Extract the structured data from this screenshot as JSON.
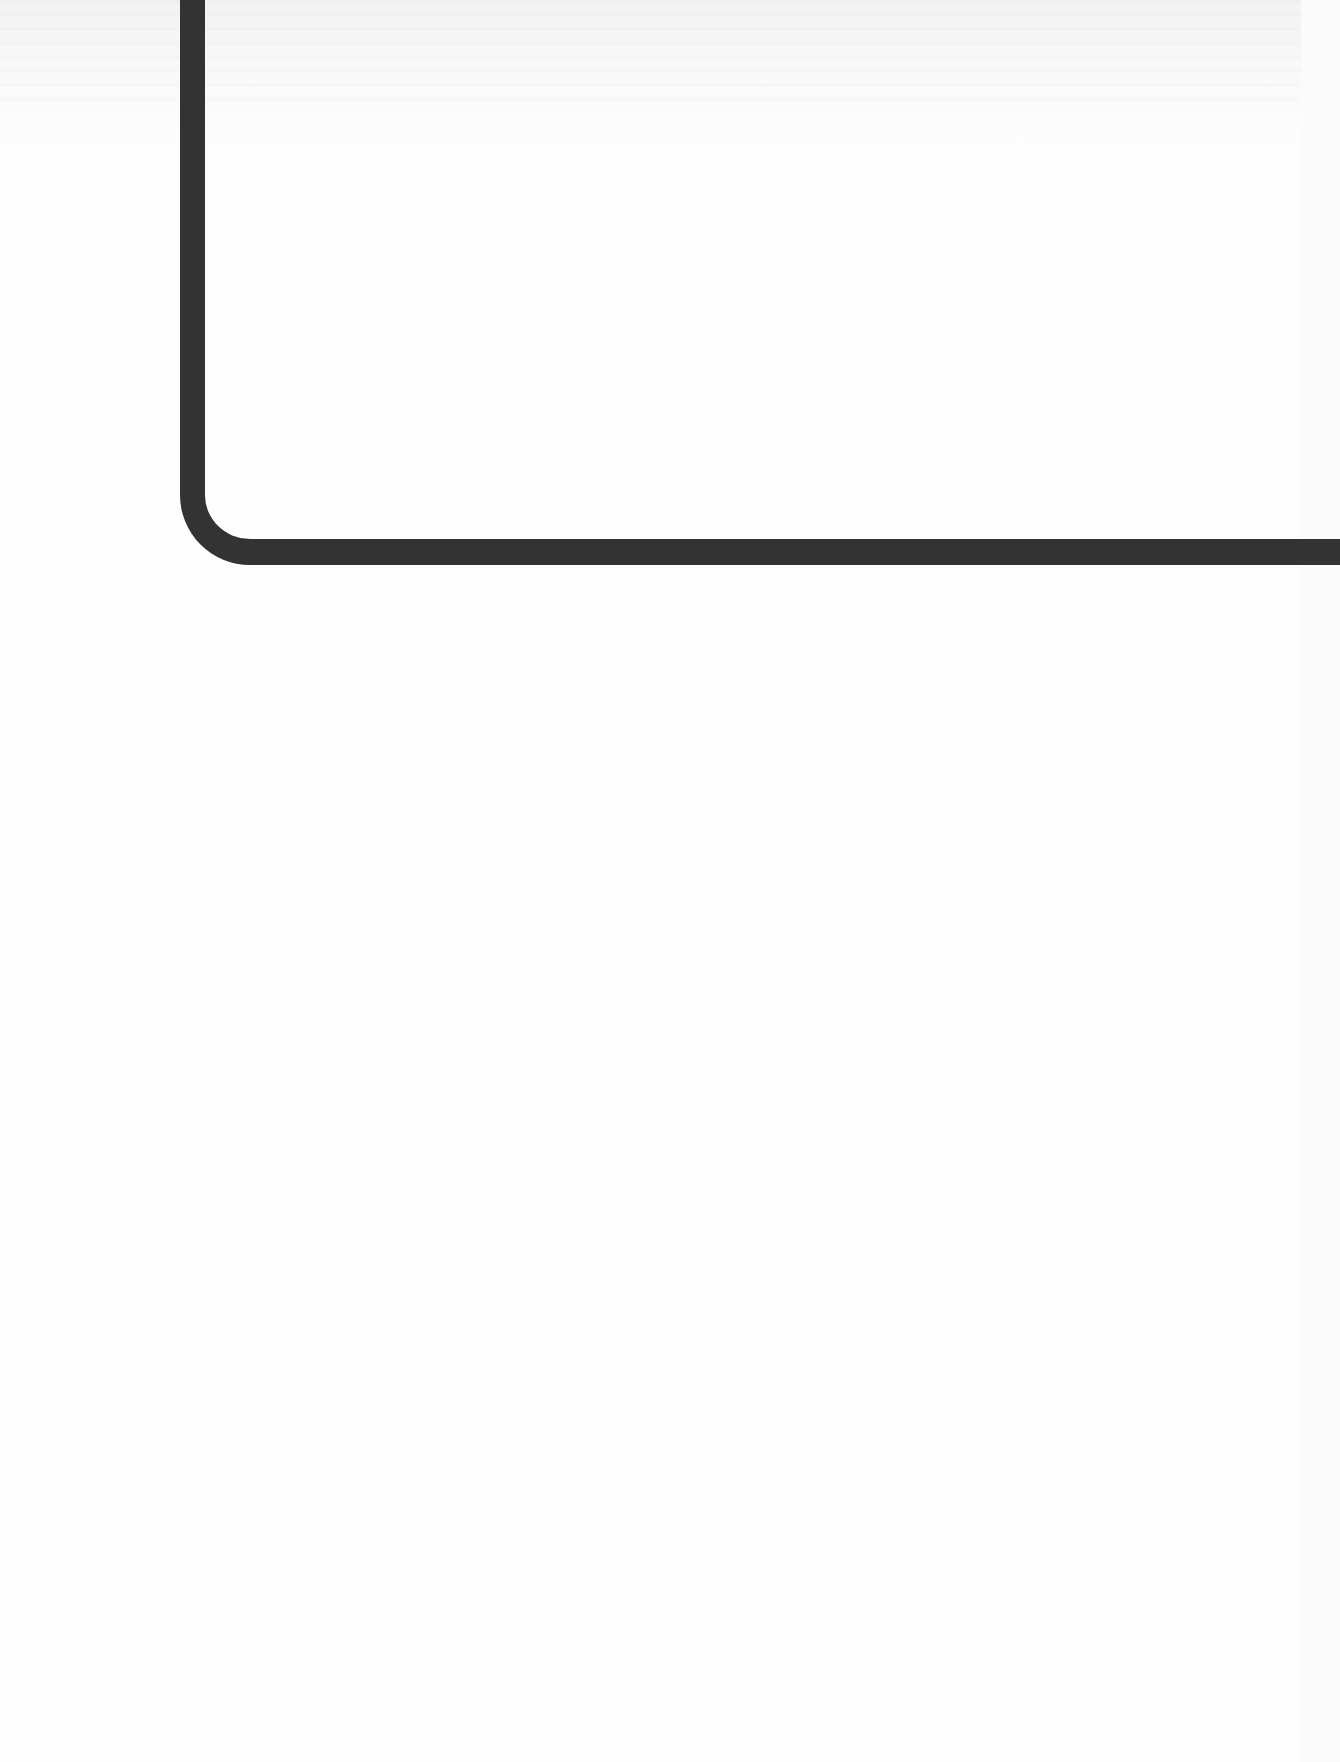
{
  "page": {
    "type": "scanned-blank-page",
    "background_color": "#fbfbfb",
    "elements": [
      {
        "name": "l-shaped-frame-line",
        "color": "#333333",
        "description": "Thick rounded L-shaped rule"
      }
    ]
  }
}
